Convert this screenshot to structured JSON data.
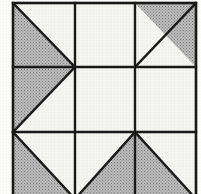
{
  "figure": {
    "background_color": "#fdfdfc",
    "line_color": "#1a1a1a",
    "white_fill": "#f5f5f2",
    "gray_fill": "#a8a8a8",
    "frame": {
      "x": 13,
      "y": 3,
      "width": 183,
      "height": 196,
      "stroke_width": 2.6
    },
    "grid": {
      "columns": 3,
      "rows": 3,
      "vertical_lines_x": [
        75,
        135
      ],
      "horizontal_lines_y": [
        67,
        132
      ],
      "column_edges_x": [
        13,
        75,
        135,
        196
      ],
      "row_edges_y": [
        3,
        67,
        132,
        199
      ],
      "stroke_width": 2.4
    },
    "cells": [
      {
        "name": "cell-top-left",
        "row": 0,
        "col": 0,
        "fill": "gray",
        "shape": "half-triangle",
        "shaded_half": "left",
        "diagonal": "top-left-to-bottom-right",
        "polygon": "13,3 75,67 13,67"
      },
      {
        "name": "cell-top-middle",
        "row": 0,
        "col": 1,
        "fill": "white",
        "shape": "plain-square",
        "shaded_half": "none",
        "diagonal": "none",
        "polygon": ""
      },
      {
        "name": "cell-top-right",
        "row": 0,
        "col": 2,
        "fill": "gray",
        "shape": "half-triangle",
        "shaded_half": "upper-right",
        "diagonal": "bottom-left-to-top-right",
        "polygon": "135,3 196,3 196,67"
      },
      {
        "name": "cell-middle-left",
        "row": 1,
        "col": 0,
        "fill": "gray",
        "shape": "half-triangle",
        "shaded_half": "upper-left",
        "diagonal": "bottom-left-to-top-right",
        "polygon": "13,67 75,67 13,132"
      },
      {
        "name": "cell-middle-center",
        "row": 1,
        "col": 1,
        "fill": "white",
        "shape": "plain-square",
        "shaded_half": "none",
        "diagonal": "none",
        "polygon": ""
      },
      {
        "name": "cell-middle-right",
        "row": 1,
        "col": 2,
        "fill": "white",
        "shape": "plain-square",
        "shaded_half": "none",
        "diagonal": "none",
        "polygon": ""
      },
      {
        "name": "cell-bottom-left",
        "row": 2,
        "col": 0,
        "fill": "gray",
        "shape": "half-triangle",
        "shaded_half": "lower-left",
        "diagonal": "top-left-to-bottom-right",
        "polygon": "13,132 75,199 13,199"
      },
      {
        "name": "cell-bottom-middle",
        "row": 2,
        "col": 1,
        "fill": "gray",
        "shape": "half-triangle",
        "shaded_half": "lower-right",
        "diagonal": "bottom-left-to-top-right",
        "polygon": "135,132 135,199 75,199"
      },
      {
        "name": "cell-bottom-right",
        "row": 2,
        "col": 2,
        "fill": "gray",
        "shape": "half-triangle",
        "shaded_half": "lower-left",
        "diagonal": "top-left-to-bottom-right",
        "polygon": "135,132 196,199 135,199"
      }
    ],
    "diagonal_lines": [
      {
        "name": "diagonal-top-left",
        "x1": 13,
        "y1": 3,
        "x2": 75,
        "y2": 67
      },
      {
        "name": "diagonal-top-right",
        "x1": 135,
        "y1": 67,
        "x2": 196,
        "y2": 3
      },
      {
        "name": "diagonal-middle-left",
        "x1": 13,
        "y1": 132,
        "x2": 75,
        "y2": 67
      },
      {
        "name": "diagonal-bottom-left",
        "x1": 13,
        "y1": 132,
        "x2": 75,
        "y2": 199
      },
      {
        "name": "diagonal-bottom-middle",
        "x1": 75,
        "y1": 199,
        "x2": 135,
        "y2": 132
      },
      {
        "name": "diagonal-bottom-right",
        "x1": 135,
        "y1": 132,
        "x2": 196,
        "y2": 199
      }
    ]
  }
}
